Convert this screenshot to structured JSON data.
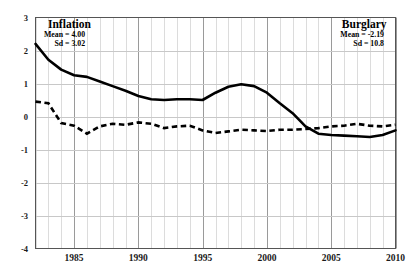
{
  "chart_data": {
    "type": "line",
    "title": "",
    "xlabel": "",
    "ylabel": "",
    "xlim": [
      1982,
      2010
    ],
    "ylim": [
      -4,
      3
    ],
    "grid": true,
    "legend_position": "in-plot-annotations",
    "yticks": [
      3,
      2,
      1,
      0,
      -1,
      -2,
      -3,
      -4
    ],
    "ytick_labels": [
      "3",
      "2",
      "1",
      "0",
      "-1",
      "-2",
      "-3",
      "-4"
    ],
    "xticks": [
      1985,
      1990,
      1995,
      2000,
      2005,
      2010
    ],
    "xtick_labels": [
      "1985",
      "1990",
      "1995",
      "2000",
      "2005",
      "2010"
    ],
    "x": [
      1982,
      1983,
      1984,
      1985,
      1986,
      1987,
      1988,
      1989,
      1990,
      1991,
      1992,
      1993,
      1994,
      1995,
      1996,
      1997,
      1998,
      1999,
      2000,
      2001,
      2002,
      2003,
      2004,
      2005,
      2006,
      2007,
      2008,
      2009,
      2010
    ],
    "series": [
      {
        "name": "Inflation",
        "style": "solid",
        "color": "#000000",
        "mean": 4.0,
        "sd": 3.02,
        "values": [
          2.2,
          1.72,
          1.42,
          1.25,
          1.2,
          1.06,
          0.92,
          0.78,
          0.62,
          0.52,
          0.5,
          0.52,
          0.52,
          0.5,
          0.72,
          0.9,
          0.98,
          0.92,
          0.72,
          0.4,
          0.1,
          -0.3,
          -0.52,
          -0.56,
          -0.58,
          -0.6,
          -0.62,
          -0.56,
          -0.42
        ]
      },
      {
        "name": "Burglary",
        "style": "dashed",
        "color": "#000000",
        "mean": -2.19,
        "sd": 10.8,
        "values": [
          0.45,
          0.4,
          -0.2,
          -0.28,
          -0.52,
          -0.3,
          -0.22,
          -0.25,
          -0.18,
          -0.22,
          -0.35,
          -0.3,
          -0.28,
          -0.42,
          -0.5,
          -0.45,
          -0.4,
          -0.42,
          -0.44,
          -0.4,
          -0.4,
          -0.38,
          -0.35,
          -0.3,
          -0.28,
          -0.22,
          -0.28,
          -0.3,
          -0.25
        ]
      }
    ],
    "series_raw_paths": {
      "inflation_px": "35,85 49,98 62,108 75,114 88,116 101,121 114,126 127,131 140,137 153,141 166,142 179,141 192,141 205,142 218,135 231,129 244,126 257,129 270,135 283,143 296,151 309,164 322,170 335,171 348,172 361,173 374,184 387,166 395,160",
      "burglary_px": "35,143 49,145 62,165 75,168 88,178 101,169 114,166 127,167 140,248 153,160 166,58 179,60 192,155 205,180 218,162 231,128 244,130 257,131 270,128 283,129 296,130 309,132 322,130 335,62 348,128 361,150 374,175 387,150 395,131"
    },
    "annotations": [
      {
        "id": "inflation",
        "title": "Inflation",
        "line1": "Mean = 4.00",
        "line2": "Sd = 3.02"
      },
      {
        "id": "burglary",
        "title": "Burglary",
        "line1": "Mean = -2.19",
        "line2": "Sd =  10.8"
      }
    ],
    "axis_colors": {
      "frame": "#404040",
      "minor_grid": "#d6d6d6",
      "major_grid": "#9a9a9a",
      "text": "#1a1a1a"
    }
  }
}
